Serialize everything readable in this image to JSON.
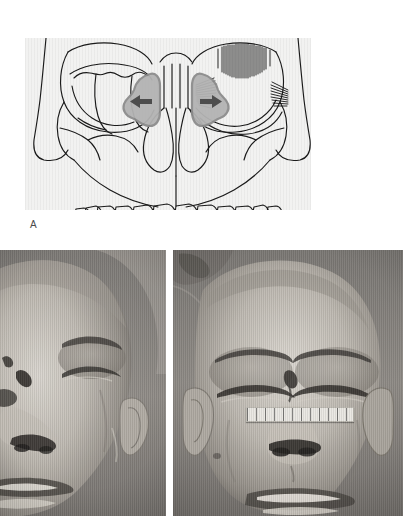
{
  "figure": {
    "panel_a": {
      "label": "A",
      "caption_text": "",
      "background_tint": "#f2f2f1",
      "line_color": "#1a1a1a",
      "fragment_fill": "#b3b3b3",
      "fragment_stroke": "#8c8c8c",
      "arrow_color": "#4d4d4d",
      "illustration_name": "frontal-skull-diagram",
      "structures": [
        {
          "name": "frontal-bone",
          "side": "midline"
        },
        {
          "name": "left-orbit-comminuted-fracture",
          "side": "left"
        },
        {
          "name": "right-orbit",
          "side": "right"
        },
        {
          "name": "nasal-aperture",
          "side": "midline"
        },
        {
          "name": "nasal-septum",
          "side": "midline"
        },
        {
          "name": "zygomatic-arch-left",
          "side": "left"
        },
        {
          "name": "zygomatic-arch-right",
          "side": "right"
        },
        {
          "name": "maxilla",
          "side": "midline"
        },
        {
          "name": "maxillary-teeth",
          "side": "midline"
        },
        {
          "name": "medial-canthal-tendon-hatching",
          "side": "right"
        },
        {
          "name": "lateral-canthal-tendon-hatching",
          "side": "right"
        },
        {
          "name": "superior-orbital-rim-hatching",
          "side": "right"
        }
      ],
      "arrows": [
        {
          "name": "left-fragment-displacement-arrow",
          "direction": "left",
          "meaning": "lateral displacement of bone fragment"
        },
        {
          "name": "right-fragment-displacement-arrow",
          "direction": "right",
          "meaning": "lateral displacement of bone fragment"
        }
      ],
      "bone_fragments": [
        {
          "name": "left-nasoethmoid-fragment",
          "side": "left"
        },
        {
          "name": "right-nasoethmoid-fragment",
          "side": "right"
        }
      ],
      "teeth_count": 12
    },
    "photos": [
      {
        "name": "clinical-photo-left",
        "view": "oblique frontal face, supine patient",
        "findings": [
          "periorbital-edema",
          "forehead-laceration",
          "nasal-laceration",
          "lip-abrasion"
        ],
        "has_ruler": false,
        "ruler_label": ""
      },
      {
        "name": "clinical-photo-right",
        "view": "frontal face, supine patient",
        "findings": [
          "bilateral-periorbital-edema",
          "glabellar-laceration",
          "nasal-laceration",
          "lip-abrasion"
        ],
        "has_ruler": true,
        "ruler_label": "measurement-scale"
      }
    ]
  }
}
